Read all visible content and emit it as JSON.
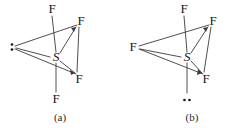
{
  "figure": {
    "width": 235,
    "height": 128,
    "background_color": "#ffffff",
    "line_color": "#3b3b40",
    "text_color": "#17171a"
  },
  "panels": [
    {
      "id": "a",
      "caption": "(a)",
      "caption_position": {
        "x": 60,
        "y": 112
      },
      "central_atom": {
        "label": "S",
        "x": 56,
        "y": 57
      },
      "lone_pair": {
        "name": "lone-pair-equatorial",
        "orientation": "vertical-pair",
        "x": 12,
        "y": 47,
        "dot_radius": 1.3,
        "dot_gap": 5
      },
      "ligands": [
        {
          "label": "F",
          "position": "axial-top",
          "x": 52,
          "y": 9
        },
        {
          "label": "F",
          "position": "equatorial-upper-right",
          "x": 81,
          "y": 21
        },
        {
          "label": "F",
          "position": "equatorial-lower-right",
          "x": 79,
          "y": 79
        },
        {
          "label": "F",
          "position": "axial-bottom",
          "x": 56,
          "y": 99
        }
      ],
      "bonds": [
        {
          "from": "S",
          "to": "F-axial-top",
          "x1": 56,
          "y1": 52,
          "x2": 52,
          "y2": 16,
          "style": "solid"
        },
        {
          "from": "S",
          "to": "F-axial-bottom",
          "x1": 56,
          "y1": 63,
          "x2": 56,
          "y2": 92,
          "style": "solid"
        },
        {
          "from": "S",
          "to": "F-eq-upper-right",
          "x1": 60,
          "y1": 53,
          "x2": 76,
          "y2": 27,
          "style": "solid"
        },
        {
          "from": "S",
          "to": "F-eq-lower-right",
          "x1": 60,
          "y1": 61,
          "x2": 75,
          "y2": 73,
          "style": "solid"
        },
        {
          "from": "S",
          "to": "lone-pair",
          "x1": 50,
          "y1": 57,
          "x2": 15,
          "y2": 48,
          "style": "solid"
        }
      ],
      "frame_edges": [
        {
          "from": "lone-pair",
          "to": "F-eq-upper-right",
          "x1": 15,
          "y1": 46,
          "x2": 77,
          "y2": 25
        },
        {
          "from": "lone-pair",
          "to": "F-eq-lower-right",
          "x1": 15,
          "y1": 49,
          "x2": 76,
          "y2": 74
        },
        {
          "from": "F-eq-upper-right",
          "to": "F-eq-lower-right",
          "x1": 79,
          "y1": 27,
          "x2": 77,
          "y2": 72
        }
      ],
      "arrowheads": [
        {
          "on": "S-to-F-eq-upper-right",
          "x": 76,
          "y": 27,
          "angle": -58
        },
        {
          "on": "S-to-F-eq-lower-right",
          "x": 75,
          "y": 73,
          "angle": 39
        }
      ]
    },
    {
      "id": "b",
      "caption": "(b)",
      "caption_position": {
        "x": 75,
        "y": 112
      },
      "central_atom": {
        "label": "S",
        "x": 70,
        "y": 57
      },
      "lone_pair": {
        "name": "lone-pair-axial",
        "orientation": "horizontal-pair",
        "x": 70,
        "y": 100,
        "dot_radius": 1.3,
        "dot_gap": 5
      },
      "ligands": [
        {
          "label": "F",
          "position": "axial-top",
          "x": 67,
          "y": 9
        },
        {
          "label": "F",
          "position": "equatorial-upper-right",
          "x": 96,
          "y": 21
        },
        {
          "label": "F",
          "position": "equatorial-lower-right",
          "x": 89,
          "y": 79
        },
        {
          "label": "F",
          "position": "equatorial-left",
          "x": 16,
          "y": 47
        }
      ],
      "bonds": [
        {
          "from": "S",
          "to": "F-axial-top",
          "x1": 70,
          "y1": 52,
          "x2": 67,
          "y2": 16,
          "style": "solid"
        },
        {
          "from": "S",
          "to": "lone-pair",
          "x1": 70,
          "y1": 63,
          "x2": 70,
          "y2": 93,
          "style": "solid"
        },
        {
          "from": "S",
          "to": "F-eq-upper-right",
          "x1": 74,
          "y1": 53,
          "x2": 91,
          "y2": 27,
          "style": "solid"
        },
        {
          "from": "S",
          "to": "F-eq-lower-right",
          "x1": 74,
          "y1": 61,
          "x2": 85,
          "y2": 73,
          "style": "solid"
        },
        {
          "from": "S",
          "to": "F-eq-left",
          "x1": 64,
          "y1": 57,
          "x2": 22,
          "y2": 49,
          "style": "solid"
        }
      ],
      "frame_edges": [
        {
          "from": "F-eq-left",
          "to": "F-eq-upper-right",
          "x1": 22,
          "y1": 46,
          "x2": 92,
          "y2": 25
        },
        {
          "from": "F-eq-left",
          "to": "F-eq-lower-right",
          "x1": 22,
          "y1": 49,
          "x2": 86,
          "y2": 74
        },
        {
          "from": "F-eq-upper-right",
          "to": "F-eq-lower-right",
          "x1": 94,
          "y1": 27,
          "x2": 87,
          "y2": 72
        }
      ],
      "arrowheads": [
        {
          "on": "S-to-F-eq-upper-right",
          "x": 91,
          "y": 27,
          "angle": -57
        },
        {
          "on": "S-to-F-eq-lower-right",
          "x": 85,
          "y": 73,
          "angle": 47
        }
      ]
    }
  ]
}
